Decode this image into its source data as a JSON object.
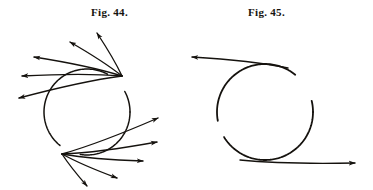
{
  "page": {
    "background_color": "#ffffff",
    "ink_color": "#15120e",
    "width": 373,
    "height": 190,
    "kind": "engraved-figure-plate"
  },
  "figures": [
    {
      "id": "fig-44",
      "caption": "Fig. 44.",
      "caption_pos": {
        "x": 91,
        "y": 6
      },
      "description": "Circle with two tangent points, each radiating a fan of straight arrows outward.",
      "circle": {
        "cx": 87,
        "cy": 112,
        "r": 43
      },
      "arc_gaps_deg": [
        {
          "start": 300,
          "end": 330
        },
        {
          "start": 100,
          "end": 128
        }
      ],
      "tangent_nodes": [
        {
          "name": "upper-node",
          "x": 122,
          "y": 76
        },
        {
          "name": "lower-node",
          "x": 62,
          "y": 154
        }
      ],
      "arrows": [
        {
          "from": [
            122,
            76
          ],
          "to": [
            97,
            33
          ],
          "group": "upper"
        },
        {
          "from": [
            122,
            76
          ],
          "to": [
            70,
            42
          ],
          "group": "upper"
        },
        {
          "from": [
            122,
            76
          ],
          "to": [
            34,
            57
          ],
          "group": "upper"
        },
        {
          "from": [
            122,
            76
          ],
          "to": [
            22,
            76
          ],
          "group": "upper"
        },
        {
          "from": [
            122,
            76
          ],
          "to": [
            19,
            98
          ],
          "group": "upper"
        },
        {
          "from": [
            62,
            154
          ],
          "to": [
            158,
            118
          ],
          "group": "lower"
        },
        {
          "from": [
            62,
            154
          ],
          "to": [
            157,
            142
          ],
          "group": "lower"
        },
        {
          "from": [
            62,
            154
          ],
          "to": [
            143,
            161
          ],
          "group": "lower"
        },
        {
          "from": [
            62,
            154
          ],
          "to": [
            117,
            178
          ],
          "group": "lower"
        },
        {
          "from": [
            62,
            154
          ],
          "to": [
            87,
            186
          ],
          "group": "lower"
        }
      ]
    },
    {
      "id": "fig-45",
      "caption": "Fig. 45.",
      "caption_pos": {
        "x": 248,
        "y": 6
      },
      "description": "Circle with two broken arcs; a horizontal arrow leaves the top toward the left and a horizontal arrow leaves the bottom toward the right.",
      "circle": {
        "cx": 265,
        "cy": 112,
        "r": 48
      },
      "arc_gaps_deg": [
        {
          "start": 310,
          "end": 345
        },
        {
          "start": 150,
          "end": 168
        }
      ],
      "arrows": [
        {
          "from": [
            288,
            68
          ],
          "to": [
            192,
            57
          ],
          "group": "top",
          "direction": "left"
        },
        {
          "from": [
            240,
            160
          ],
          "to": [
            355,
            163
          ],
          "group": "bottom",
          "direction": "right"
        }
      ]
    }
  ]
}
